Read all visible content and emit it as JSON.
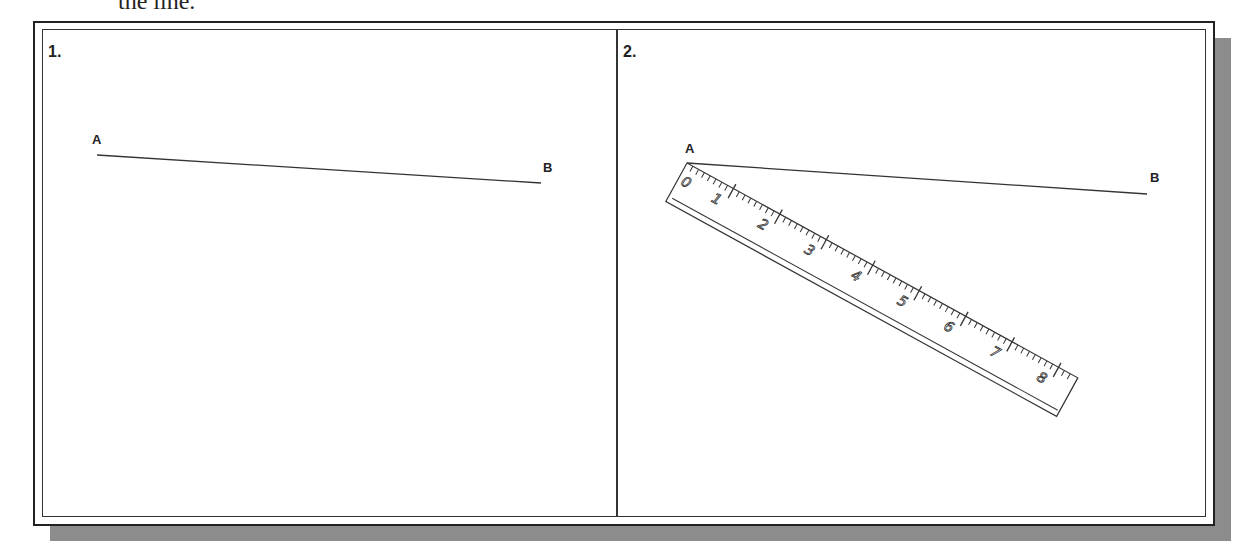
{
  "caption": "the line.",
  "panels": [
    {
      "number": "1.",
      "line": {
        "start_label": "A",
        "end_label": "B",
        "x1": 97,
        "y1": 155,
        "x2": 541,
        "y2": 183
      },
      "label_a": {
        "x": 92,
        "y": 144
      },
      "label_b": {
        "x": 543,
        "y": 172
      }
    },
    {
      "number": "2.",
      "line": {
        "start_label": "A",
        "end_label": "B",
        "x1": 687,
        "y1": 163,
        "x2": 1147,
        "y2": 194
      },
      "label_a": {
        "x": 685,
        "y": 153
      },
      "label_b": {
        "x": 1150,
        "y": 182
      },
      "ruler": {
        "origin_x": 687,
        "origin_y": 163,
        "angle_deg": 28.8,
        "length": 446,
        "width": 44,
        "unit_px": 53,
        "numbers": [
          "0",
          "1",
          "2",
          "3",
          "4",
          "5",
          "6",
          "7",
          "8"
        ]
      }
    }
  ],
  "colors": {
    "ink": "#222222",
    "shadow": "#8c8c8c",
    "paper": "#ffffff"
  }
}
